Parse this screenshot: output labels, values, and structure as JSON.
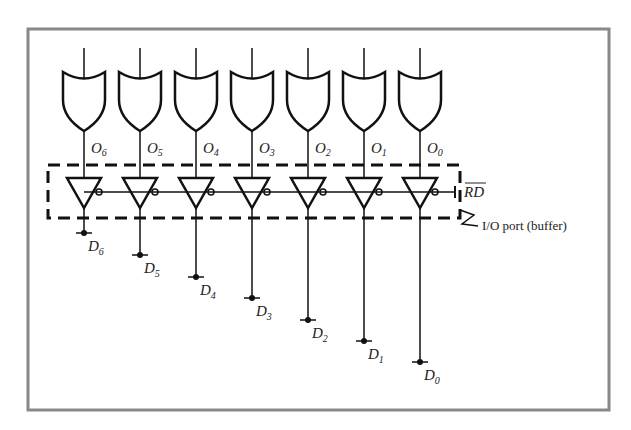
{
  "diagram": {
    "port_label": "I/O port (buffer)",
    "control_signal": "RD",
    "control_signal_overbar": true,
    "colors": {
      "frame": "#888888",
      "line": "#111111",
      "background": "#ffffff"
    },
    "gates": [
      {
        "output": "O",
        "output_sub": "6",
        "data": "D",
        "data_sub": "6"
      },
      {
        "output": "O",
        "output_sub": "5",
        "data": "D",
        "data_sub": "5"
      },
      {
        "output": "O",
        "output_sub": "4",
        "data": "D",
        "data_sub": "4"
      },
      {
        "output": "O",
        "output_sub": "3",
        "data": "D",
        "data_sub": "3"
      },
      {
        "output": "O",
        "output_sub": "2",
        "data": "D",
        "data_sub": "2"
      },
      {
        "output": "O",
        "output_sub": "1",
        "data": "D",
        "data_sub": "1"
      },
      {
        "output": "O",
        "output_sub": "0",
        "data": "D",
        "data_sub": "0"
      }
    ]
  }
}
